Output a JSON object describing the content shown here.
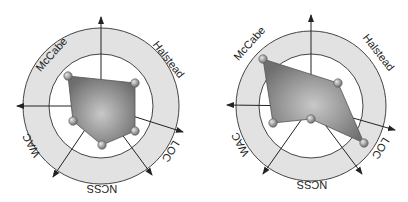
{
  "colors": {
    "ring_fill": "#e2e2e2",
    "ring_stroke": "#444444",
    "polygon_fill": "#8c8c8c",
    "polygon_highlight": "#c8c8c8",
    "vertex_fill": "#9a9a9a",
    "axis_stroke": "#222222"
  },
  "chart_data": [
    {
      "type": "radar",
      "title": "",
      "axes": [
        "McCabe",
        "Halstead",
        "LOC",
        "NCSS",
        "WAC"
      ],
      "series": [
        {
          "name": "left",
          "values": [
            0.86,
            0.79,
            0.81,
            0.75,
            0.61
          ]
        }
      ],
      "scale_note": "values normalized to inner circle radius = 1.0; outer ring edge = 1.5",
      "grid": "two concentric circles, shaded ring between them",
      "geometry": {
        "center": [
          101,
          106
        ],
        "inner_r": 52,
        "outer_r": 78,
        "vertices": [
          [
            68,
            76
          ],
          [
            135,
            83
          ],
          [
            135,
            131
          ],
          [
            102,
            145
          ],
          [
            73,
            121
          ]
        ],
        "arrow_tips": [
          [
            101,
            17
          ],
          [
            183,
            132
          ],
          [
            152,
            175
          ],
          [
            53,
            177
          ],
          [
            17,
            106
          ]
        ],
        "labels": [
          {
            "text": "McCabe",
            "x": 52,
            "y": 55,
            "rotate": -48
          },
          {
            "text": "Halstead",
            "x": 168,
            "y": 60,
            "rotate": 52
          },
          {
            "text": "LOC",
            "x": 170,
            "y": 151,
            "rotate": 122
          },
          {
            "text": "NCSS",
            "x": 102,
            "y": 188,
            "rotate": 180
          },
          {
            "text": "WAC",
            "x": 32,
            "y": 145,
            "rotate": -118
          }
        ]
      }
    },
    {
      "type": "radar",
      "title": "",
      "axes": [
        "McCabe",
        "Halstead",
        "LOC",
        "NCSS",
        "WAC"
      ],
      "series": [
        {
          "name": "right",
          "values": [
            1.29,
            0.68,
            1.24,
            0.25,
            0.8
          ]
        }
      ],
      "scale_note": "values normalized to inner circle radius = 1.0; outer ring edge = 1.5",
      "grid": "two concentric circles, shaded ring between them",
      "geometry": {
        "center": [
          311,
          106
        ],
        "inner_r": 52,
        "outer_r": 75,
        "vertices": [
          [
            263,
            59
          ],
          [
            338,
            83
          ],
          [
            364,
            143
          ],
          [
            311,
            119
          ],
          [
            273,
            123
          ]
        ],
        "arrow_tips": [
          [
            311,
            15
          ],
          [
            395,
            130
          ],
          [
            362,
            174
          ],
          [
            263,
            174
          ],
          [
            227,
            105
          ]
        ],
        "labels": [
          {
            "text": "McCabe",
            "x": 250,
            "y": 44,
            "rotate": -48
          },
          {
            "text": "Halstead",
            "x": 378,
            "y": 53,
            "rotate": 52
          },
          {
            "text": "LOC",
            "x": 380,
            "y": 148,
            "rotate": 122
          },
          {
            "text": "NCSS",
            "x": 312,
            "y": 184,
            "rotate": 180
          },
          {
            "text": "WAC",
            "x": 241,
            "y": 144,
            "rotate": -118
          }
        ]
      }
    }
  ]
}
